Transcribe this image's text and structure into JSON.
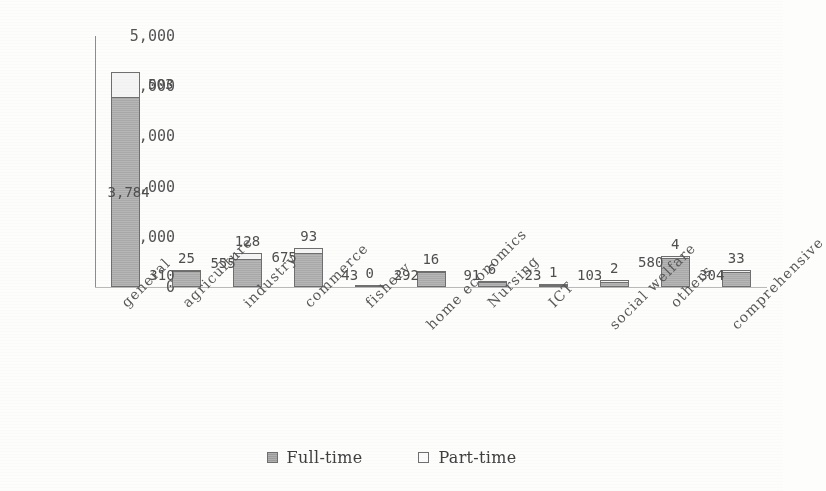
{
  "chart_data": {
    "type": "bar",
    "subtype": "stacked-column",
    "title": "",
    "xlabel": "",
    "ylabel": "",
    "ylim": [
      0,
      5000
    ],
    "ytick_labels": [
      "0",
      "1,000",
      "2,000",
      "3,000",
      "4,000",
      "5,000"
    ],
    "ytick_values": [
      0,
      1000,
      2000,
      3000,
      4000,
      5000
    ],
    "grid": false,
    "legend_position": "bottom-center",
    "categories": [
      "general",
      "agriculture",
      "industry",
      "commerce",
      "fishery",
      "home economics",
      "Nursing",
      "ICT",
      "social welfare",
      "others",
      "comprehensive"
    ],
    "series": [
      {
        "name": "Full-time",
        "color": "#a9a9a9",
        "values": [
          3784,
          310,
          555,
          675,
          43,
          292,
          91,
          23,
          103,
          580,
          304
        ],
        "labels": [
          "3,784",
          "310",
          "555",
          "675",
          "43",
          "292",
          "91",
          "23",
          "103",
          "580",
          "304"
        ]
      },
      {
        "name": "Part-time",
        "color": "#f4f4f4",
        "values": [
          503,
          25,
          128,
          93,
          0,
          16,
          6,
          1,
          2,
          4,
          33
        ],
        "labels": [
          "503",
          "25",
          "128",
          "93",
          "0",
          "16",
          "6",
          "1",
          "2",
          "4",
          "33"
        ]
      }
    ]
  },
  "legend": {
    "items": [
      {
        "label": "Full-time",
        "swatch": "filled-gray-square"
      },
      {
        "label": "Part-time",
        "swatch": "empty-white-square"
      }
    ]
  }
}
